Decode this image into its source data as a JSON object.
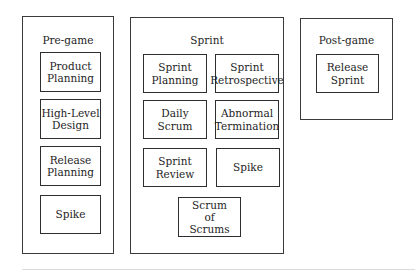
{
  "diagram": {
    "phases": [
      {
        "title": "Pre-game",
        "activities": [
          {
            "label": "Product\nPlanning"
          },
          {
            "label": "High-Level\nDesign"
          },
          {
            "label": "Release\nPlanning"
          },
          {
            "label": "Spike"
          }
        ]
      },
      {
        "title": "Sprint",
        "activities": [
          {
            "label": "Sprint\nPlanning"
          },
          {
            "label": "Sprint\nRetrospective"
          },
          {
            "label": "Daily\nScrum"
          },
          {
            "label": "Abnormal\nTermination"
          },
          {
            "label": "Sprint\nReview"
          },
          {
            "label": "Spike"
          },
          {
            "label": "Scrum\nof\nScrums"
          }
        ]
      },
      {
        "title": "Post-game",
        "activities": [
          {
            "label": "Release\nSprint"
          }
        ]
      }
    ],
    "colors": {
      "border": "#3a3a3a",
      "text": "#1e1e1e",
      "background": "#ffffff"
    }
  }
}
